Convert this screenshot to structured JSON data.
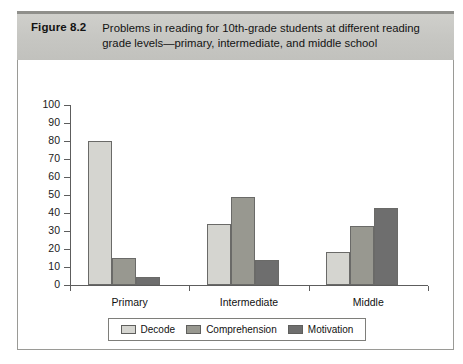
{
  "figure": {
    "label": "Figure 8.2",
    "caption": "Problems in reading for 10th-grade students at different reading grade levels—primary, intermediate, and middle school"
  },
  "colors": {
    "decode": "#d5d5d0",
    "comprehension": "#989890",
    "motivation": "#6e6e6e",
    "band": "#c6c6c2",
    "axis": "#5d5d5d",
    "frame": "#9a9a96"
  },
  "chart_data": {
    "type": "bar",
    "title": "Problems in reading for 10th-grade students at different reading grade levels—primary, intermediate, and middle school",
    "xlabel": "",
    "ylabel": "",
    "ylim": [
      0,
      100
    ],
    "yticks": [
      0,
      10,
      20,
      30,
      40,
      50,
      60,
      70,
      80,
      90,
      100
    ],
    "ytick_labels": [
      "0",
      "10",
      "20",
      "30",
      "40",
      "50",
      "60",
      "70",
      "80",
      "90",
      "100"
    ],
    "grid": false,
    "legend_position": "bottom",
    "categories": [
      "Primary",
      "Intermediate",
      "Middle"
    ],
    "series": [
      {
        "name": "Decode",
        "color": "#d5d5d0",
        "values": [
          80,
          34,
          18.5
        ]
      },
      {
        "name": "Comprehension",
        "color": "#989890",
        "values": [
          15,
          49,
          33
        ]
      },
      {
        "name": "Motivation",
        "color": "#6e6e6e",
        "values": [
          4.5,
          14,
          43
        ]
      }
    ]
  }
}
